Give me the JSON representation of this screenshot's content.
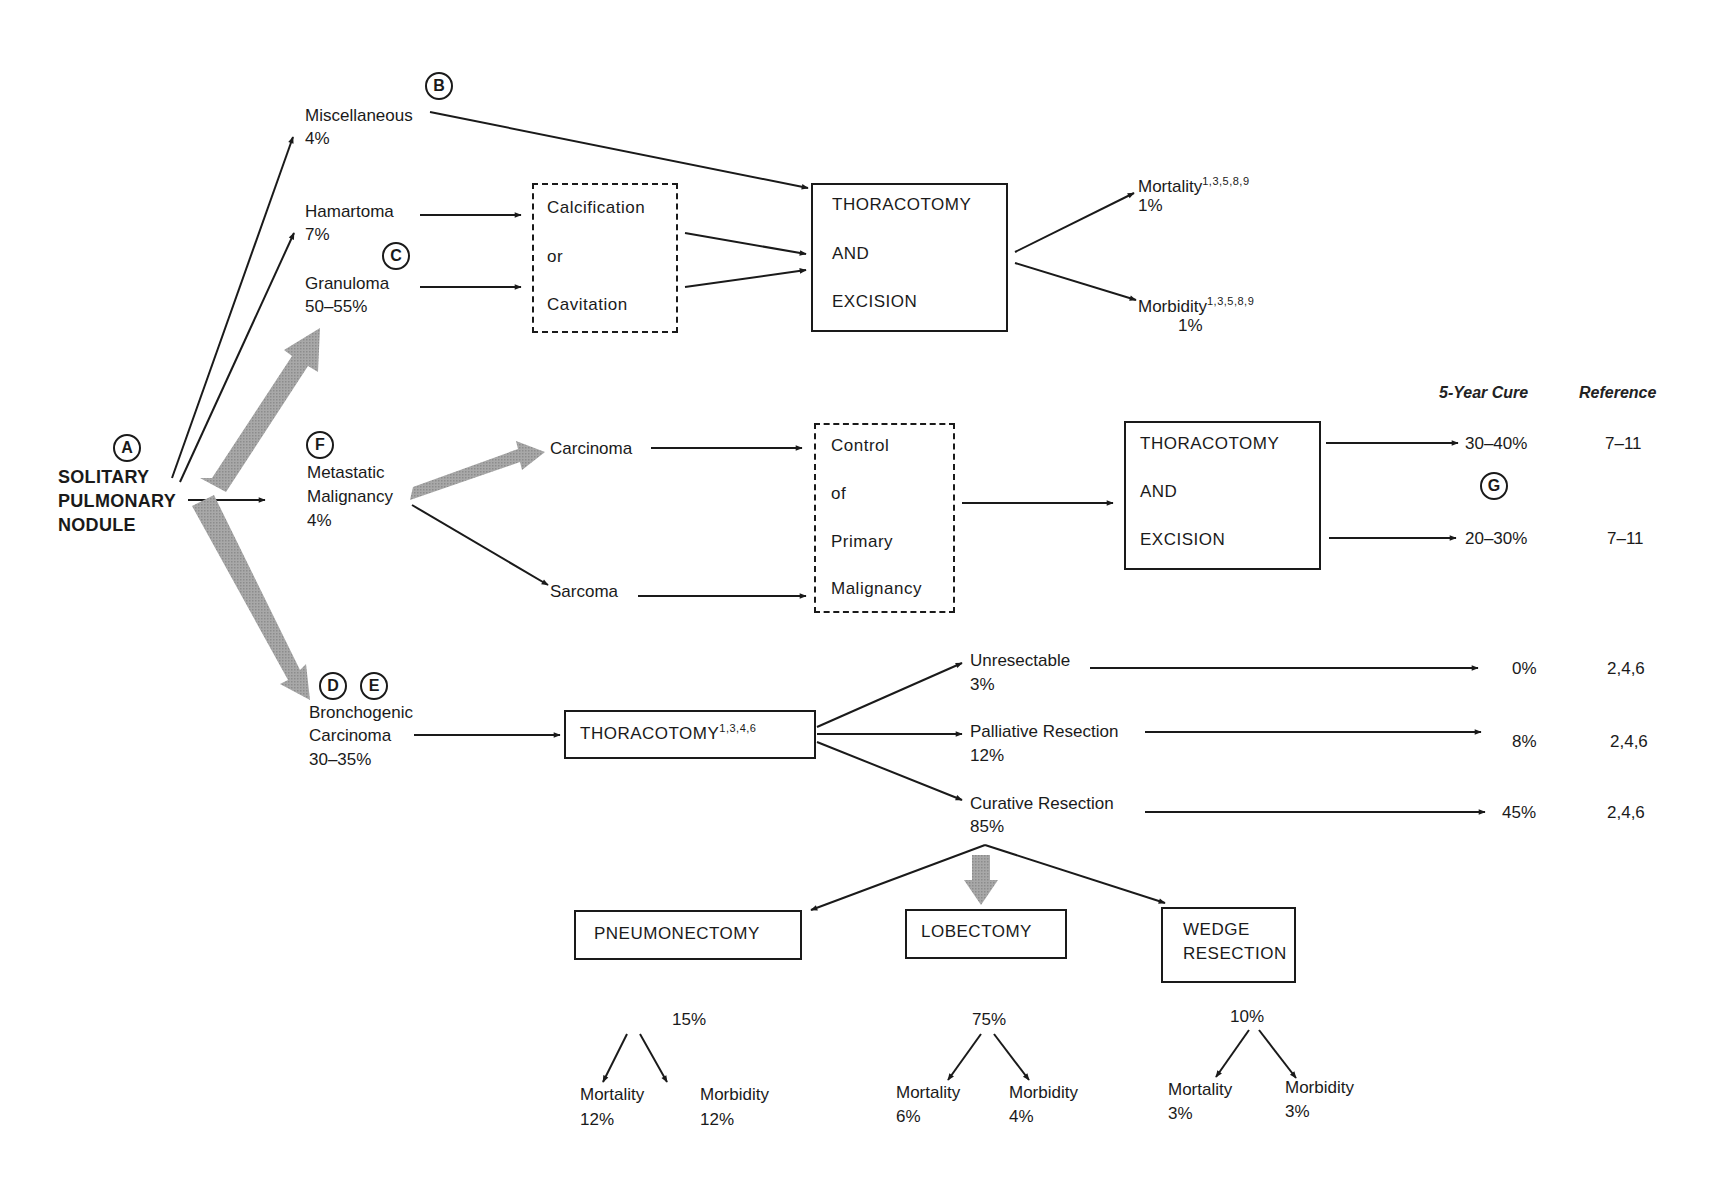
{
  "root": {
    "marker": "A",
    "label_lines": [
      "SOLITARY",
      "PULMONARY",
      "NODULE"
    ]
  },
  "benign": {
    "miscellaneous": {
      "marker": "B",
      "label": "Miscellaneous",
      "pct": "4%"
    },
    "hamartoma": {
      "label": "Hamartoma",
      "pct": "7%"
    },
    "granuloma": {
      "marker": "C",
      "label": "Granuloma",
      "pct": "50–55%"
    },
    "calcification_box": {
      "lines": [
        "Calcification",
        "or",
        "Cavitation"
      ]
    },
    "thoracotomy_box": {
      "lines": [
        "THORACOTOMY",
        "AND",
        "EXCISION"
      ]
    },
    "outcomes": {
      "mortality": {
        "label": "Mortality",
        "refs": "1,3,5,8,9",
        "pct": "1%"
      },
      "morbidity": {
        "label": "Morbidity",
        "refs": "1,3,5,8,9",
        "pct": "1%"
      }
    }
  },
  "columns": {
    "cure": "5-Year Cure",
    "reference": "Reference"
  },
  "metastatic": {
    "marker": "F",
    "label_lines": [
      "Metastatic",
      "Malignancy"
    ],
    "pct": "4%",
    "carcinoma": "Carcinoma",
    "sarcoma": "Sarcoma",
    "control_box": {
      "lines": [
        "Control",
        "of",
        "Primary",
        "Malignancy"
      ]
    },
    "thoracotomy_box": {
      "lines": [
        "THORACOTOMY",
        "AND",
        "EXCISION"
      ]
    },
    "marker_g": "G",
    "results": [
      {
        "cure": "30–40%",
        "ref": "7–11"
      },
      {
        "cure": "20–30%",
        "ref": "7–11"
      }
    ]
  },
  "bronchogenic": {
    "markers": [
      "D",
      "E"
    ],
    "label_lines": [
      "Bronchogenic",
      "Carcinoma"
    ],
    "pct": "30–35%",
    "thoracotomy": {
      "label": "THORACOTOMY",
      "refs": "1,3,4,6"
    },
    "branches": [
      {
        "label": "Unresectable",
        "pct": "3%",
        "cure": "0%",
        "ref": "2,4,6"
      },
      {
        "label": "Palliative Resection",
        "pct": "12%",
        "cure": "8%",
        "ref": "2,4,6"
      },
      {
        "label": "Curative Resection",
        "pct": "85%",
        "cure": "45%",
        "ref": "2,4,6"
      }
    ],
    "procedures": [
      {
        "label_lines": [
          "PNEUMONECTOMY"
        ],
        "pct": "15%",
        "mortality_label": "Mortality",
        "mortality": "12%",
        "morbidity_label": "Morbidity",
        "morbidity": "12%"
      },
      {
        "label_lines": [
          "LOBECTOMY"
        ],
        "pct": "75%",
        "mortality_label": "Mortality",
        "mortality": "6%",
        "morbidity_label": "Morbidity",
        "morbidity": "4%"
      },
      {
        "label_lines": [
          "WEDGE",
          "RESECTION"
        ],
        "pct": "10%",
        "mortality_label": "Mortality",
        "mortality": "3%",
        "morbidity_label": "Morbidity",
        "morbidity": "3%"
      }
    ]
  },
  "colors": {
    "ink": "#1a1a1a",
    "thick_arrow": "#9a9a9a",
    "background": "#ffffff"
  }
}
